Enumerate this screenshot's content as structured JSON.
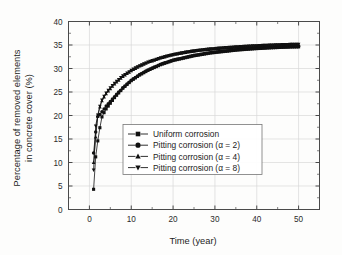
{
  "chart_data": {
    "type": "scatter",
    "title": "",
    "xlabel": "Time (year)",
    "ylabel": "Percentage of removed elements in concrete cover (%)",
    "ylabel_line1": "Percentage of removed elements",
    "ylabel_line2": "in concrete cover (%)",
    "xlim": [
      -5,
      55
    ],
    "ylim": [
      0,
      40
    ],
    "xticks": [
      0,
      10,
      20,
      30,
      40,
      50
    ],
    "xtick_labels": [
      "0",
      "10",
      "20",
      "30",
      "40",
      "50"
    ],
    "xminor_ticks": [
      -5,
      5,
      15,
      25,
      35,
      45,
      55
    ],
    "yticks": [
      0,
      5,
      10,
      15,
      20,
      25,
      30,
      35,
      40
    ],
    "ytick_labels": [
      "0",
      "5",
      "10",
      "15",
      "20",
      "25",
      "30",
      "35",
      "40"
    ],
    "grid": true,
    "legend_position": "center-left",
    "marker_color": "#101010",
    "line_color": "#141414",
    "grid_color": "#d8d8d8",
    "axis_color": "#4a4a4a",
    "series": [
      {
        "name": "Uniform corrosion",
        "marker": "square",
        "x": [
          1,
          1.5,
          2,
          2.5,
          3,
          3.5,
          4,
          4.5,
          5,
          5.5,
          6,
          6.5,
          7,
          7.5,
          8,
          8.5,
          9,
          9.5,
          10,
          11,
          12,
          13,
          14,
          15,
          16,
          17,
          18,
          19,
          20,
          21,
          22,
          23,
          24,
          25,
          26,
          27,
          28,
          29,
          30,
          31,
          32,
          33,
          34,
          35,
          36,
          37,
          38,
          39,
          40,
          41,
          42,
          43,
          44,
          45,
          46,
          47,
          48,
          49,
          50
        ],
        "y": [
          4.3,
          11.2,
          14.6,
          17.4,
          19.7,
          20.6,
          21.4,
          22.0,
          22.6,
          23.2,
          23.8,
          24.3,
          24.8,
          25.3,
          25.8,
          26.2,
          26.6,
          27.0,
          27.4,
          28.0,
          28.6,
          29.1,
          29.6,
          30.0,
          30.4,
          30.8,
          31.1,
          31.4,
          31.7,
          31.9,
          32.1,
          32.3,
          32.5,
          32.7,
          32.85,
          33.0,
          33.15,
          33.3,
          33.4,
          33.5,
          33.6,
          33.7,
          33.8,
          33.9,
          33.97,
          34.04,
          34.11,
          34.17,
          34.23,
          34.28,
          34.33,
          34.38,
          34.42,
          34.46,
          34.5,
          34.53,
          34.56,
          34.58,
          34.6
        ]
      },
      {
        "name": "Pitting corrosion (α = 2)",
        "marker": "circle",
        "x": [
          1,
          1.5,
          2,
          2.5,
          3,
          3.5,
          4,
          4.5,
          5,
          5.5,
          6,
          6.5,
          7,
          7.5,
          8,
          8.5,
          9,
          9.5,
          10,
          11,
          12,
          13,
          14,
          15,
          16,
          17,
          18,
          19,
          20,
          21,
          22,
          23,
          24,
          25,
          26,
          27,
          28,
          29,
          30,
          31,
          32,
          33,
          34,
          35,
          36,
          37,
          38,
          39,
          40,
          41,
          42,
          43,
          44,
          45,
          46,
          47,
          48,
          49,
          50
        ],
        "y": [
          12.0,
          16.5,
          19.8,
          20.2,
          20.8,
          21.4,
          22.0,
          22.5,
          23.0,
          23.5,
          24.0,
          24.5,
          25.0,
          25.4,
          25.9,
          26.3,
          26.7,
          27.1,
          27.5,
          28.1,
          28.7,
          29.2,
          29.7,
          30.1,
          30.5,
          30.9,
          31.2,
          31.5,
          31.8,
          32.0,
          32.2,
          32.4,
          32.6,
          32.8,
          32.95,
          33.1,
          33.25,
          33.4,
          33.5,
          33.6,
          33.7,
          33.8,
          33.9,
          34.0,
          34.07,
          34.14,
          34.21,
          34.27,
          34.33,
          34.38,
          34.43,
          34.48,
          34.52,
          34.56,
          34.6,
          34.63,
          34.66,
          34.68,
          34.7
        ]
      },
      {
        "name": "Pitting corrosion (α = 4)",
        "marker": "triangle-up",
        "x": [
          1,
          1.5,
          2,
          2.5,
          3,
          3.5,
          4,
          4.5,
          5,
          5.5,
          6,
          6.5,
          7,
          7.5,
          8,
          8.5,
          9,
          9.5,
          10,
          11,
          12,
          13,
          14,
          15,
          16,
          17,
          18,
          19,
          20,
          21,
          22,
          23,
          24,
          25,
          26,
          27,
          28,
          29,
          30,
          31,
          32,
          33,
          34,
          35,
          36,
          37,
          38,
          39,
          40,
          41,
          42,
          43,
          44,
          45,
          46,
          47,
          48,
          49,
          50
        ],
        "y": [
          10.0,
          15.4,
          19.9,
          21.8,
          23.1,
          23.9,
          24.6,
          25.2,
          25.7,
          26.2,
          26.7,
          27.1,
          27.5,
          27.9,
          28.3,
          28.6,
          28.9,
          29.2,
          29.5,
          30.0,
          30.5,
          30.9,
          31.3,
          31.6,
          31.9,
          32.2,
          32.45,
          32.7,
          32.9,
          33.08,
          33.25,
          33.4,
          33.55,
          33.68,
          33.8,
          33.9,
          34.0,
          34.1,
          34.18,
          34.26,
          34.33,
          34.4,
          34.46,
          34.52,
          34.58,
          34.63,
          34.68,
          34.73,
          34.78,
          34.82,
          34.86,
          34.9,
          34.94,
          34.97,
          35.0,
          35.03,
          35.06,
          35.08,
          35.1
        ]
      },
      {
        "name": "Pitting corrosion (α = 8)",
        "marker": "triangle-down",
        "x": [
          1,
          1.5,
          2,
          2.5,
          3,
          3.5,
          4,
          4.5,
          5,
          5.5,
          6,
          6.5,
          7,
          7.5,
          8,
          8.5,
          9,
          9.5,
          10,
          11,
          12,
          13,
          14,
          15,
          16,
          17,
          18,
          19,
          20,
          21,
          22,
          23,
          24,
          25,
          26,
          27,
          28,
          29,
          30,
          31,
          32,
          33,
          34,
          35,
          36,
          37,
          38,
          39,
          40,
          41,
          42,
          43,
          44,
          45,
          46,
          47,
          48,
          49,
          50
        ],
        "y": [
          8.4,
          17.8,
          20.1,
          22.0,
          23.3,
          24.1,
          24.8,
          25.4,
          25.9,
          26.4,
          26.9,
          27.3,
          27.7,
          28.1,
          28.45,
          28.75,
          29.05,
          29.35,
          29.65,
          30.15,
          30.6,
          31.0,
          31.4,
          31.7,
          32.0,
          32.3,
          32.55,
          32.8,
          33.0,
          33.18,
          33.35,
          33.5,
          33.65,
          33.78,
          33.9,
          34.0,
          34.1,
          34.2,
          34.28,
          34.36,
          34.43,
          34.5,
          34.56,
          34.62,
          34.68,
          34.73,
          34.78,
          34.83,
          34.88,
          34.92,
          34.96,
          35.0,
          35.04,
          35.07,
          35.1,
          35.13,
          35.16,
          35.18,
          35.2
        ]
      }
    ]
  }
}
